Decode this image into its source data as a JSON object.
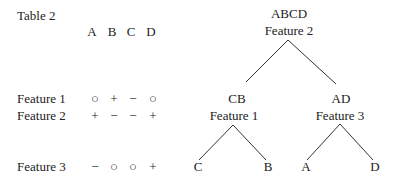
{
  "table": {
    "title": "Table 2",
    "columns": [
      "A",
      "B",
      "C",
      "D"
    ],
    "rows": [
      {
        "label": "Feature 1",
        "values": [
          "○",
          "+",
          "−",
          "○"
        ]
      },
      {
        "label": "Feature 2",
        "values": [
          "+",
          "−",
          "−",
          "+"
        ]
      },
      {
        "label": "Feature 3",
        "values": [
          "−",
          "○",
          "○",
          "+"
        ]
      }
    ]
  },
  "tree": {
    "root": {
      "set": "ABCD",
      "feature": "Feature 2"
    },
    "left": {
      "set": "CB",
      "feature": "Feature 1",
      "leaves": [
        "C",
        "B"
      ]
    },
    "right": {
      "set": "AD",
      "feature": "Feature 3",
      "leaves": [
        "A",
        "D"
      ]
    }
  }
}
